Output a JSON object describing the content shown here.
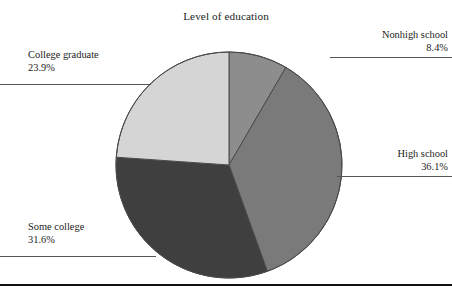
{
  "chart_data": {
    "type": "pie",
    "title": "Level of education",
    "xlabel": "",
    "ylabel": "",
    "categories": [
      "Nonhigh school",
      "High school",
      "Some college",
      "College graduate"
    ],
    "values": [
      8.4,
      36.1,
      31.6,
      23.9
    ],
    "value_labels": [
      "8.4%",
      "36.1%",
      "31.6%",
      "23.9%"
    ],
    "units": "percent",
    "start_angle_deg": 0,
    "direction": "clockwise",
    "legend": "none",
    "grid": false,
    "slice_colors": [
      "#8d8d8d",
      "#7a7a7a",
      "#3f3f3f",
      "#d5d5d5"
    ],
    "slices": [
      {
        "label": "Nonhigh school",
        "value": 8.4,
        "value_label": "8.4%",
        "color": "#8d8d8d",
        "side": "right"
      },
      {
        "label": "High school",
        "value": 36.1,
        "value_label": "36.1%",
        "color": "#7a7a7a",
        "side": "right"
      },
      {
        "label": "Some college",
        "value": 31.6,
        "value_label": "31.6%",
        "color": "#3f3f3f",
        "side": "left"
      },
      {
        "label": "College graduate",
        "value": 23.9,
        "value_label": "23.9%",
        "color": "#d5d5d5",
        "side": "left"
      }
    ]
  },
  "figure": {
    "title": "Level of education",
    "outline_color": "#555555",
    "rule_color": "#121212"
  },
  "callouts": {
    "nonhigh": {
      "label": "Nonhigh school",
      "value": "8.4%"
    },
    "highschool": {
      "label": "High school",
      "value": "36.1%"
    },
    "somecollege": {
      "label": "Some college",
      "value": "31.6%"
    },
    "collegegrad": {
      "label": "College graduate",
      "value": "23.9%"
    }
  }
}
